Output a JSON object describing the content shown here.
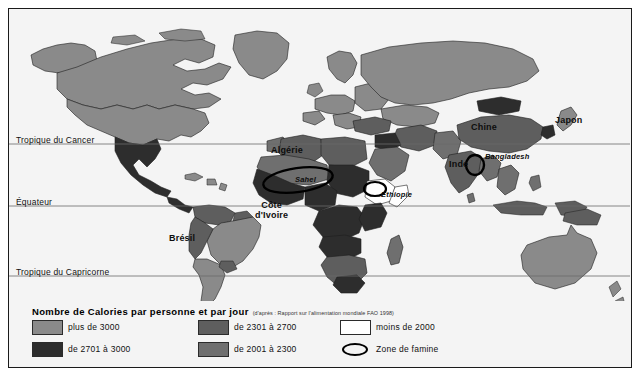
{
  "figure": {
    "kind": "thematic-world-map",
    "background_color": "#f4f4f4",
    "frame_color": "#1a1a1a"
  },
  "latitude_lines": [
    {
      "id": "tropic-cancer",
      "label": "Tropique du Cancer",
      "y": 135
    },
    {
      "id": "equator",
      "label": "Équateur",
      "y": 197
    },
    {
      "id": "tropic-capricorn",
      "label": "Tropique du Capricorne",
      "y": 267
    }
  ],
  "map_labels": [
    {
      "id": "algerie",
      "text": "Algérie",
      "x": 278,
      "y": 141
    },
    {
      "id": "cote-divoire",
      "text": "Côte",
      "text2": "d'Ivoire",
      "x": 265,
      "y": 196
    },
    {
      "id": "ethiopie",
      "text": "Éthiopie",
      "x": 372,
      "y": 186
    },
    {
      "id": "sahel",
      "text": "Sahel",
      "x": 297,
      "y": 170
    },
    {
      "id": "bresil",
      "text": "Brésil",
      "x": 175,
      "y": 229
    },
    {
      "id": "chine",
      "text": "Chine",
      "x": 478,
      "y": 118
    },
    {
      "id": "japon",
      "text": "Japon",
      "x": 561,
      "y": 111
    },
    {
      "id": "inde",
      "text": "Inde",
      "x": 457,
      "y": 155
    },
    {
      "id": "bangladesh",
      "text": "Bangladesh",
      "x": 490,
      "y": 148
    }
  ],
  "famine_zones": [
    {
      "id": "famine-sahel",
      "name": "Sahel",
      "cx": 289,
      "cy": 171,
      "rx": 35,
      "ry": 12,
      "rotation": -8
    },
    {
      "id": "famine-ethiopia",
      "name": "Éthiopie",
      "cx": 366,
      "cy": 180,
      "rx": 11,
      "ry": 7,
      "rotation": 0
    },
    {
      "id": "famine-bangladesh",
      "name": "Bangladesh",
      "cx": 466,
      "cy": 156,
      "rx": 9,
      "ry": 10,
      "rotation": 0
    }
  ],
  "legend": {
    "title": "Nombre de Calories par personne et par jour",
    "source": "(d'après : Rapport sur l'alimentation mondiale FAO 1998)",
    "columns": [
      {
        "id": "col-1",
        "entries": [
          {
            "id": "plus-3000",
            "label": "plus de 3000",
            "color": "#8a8a8a",
            "type": "swatch"
          },
          {
            "id": "2701-3000",
            "label": "de 2701 à 3000",
            "color": "#2d2d2d",
            "type": "swatch"
          }
        ]
      },
      {
        "id": "col-2",
        "entries": [
          {
            "id": "2301-2700",
            "label": "de 2301 à 2700",
            "color": "#5e5e5e",
            "type": "swatch"
          },
          {
            "id": "2001-2300",
            "label": "de 2001 à 2300",
            "color": "#6f6f6f",
            "type": "swatch"
          }
        ]
      },
      {
        "id": "col-3",
        "entries": [
          {
            "id": "moins-2000",
            "label": "moins de 2000",
            "color": "#ffffff",
            "type": "swatch"
          },
          {
            "id": "zone-famine",
            "label": "Zone de famine",
            "color": "#000000",
            "type": "ellipse"
          }
        ]
      }
    ]
  },
  "palette": {
    "plus_de_3000": "#8a8a8a",
    "de_2701_a_3000": "#2d2d2d",
    "de_2301_a_2700": "#5e5e5e",
    "de_2001_a_2300": "#6f6f6f",
    "moins_de_2000": "#ffffff",
    "ocean": "#f4f4f4",
    "border": "#1f1f1f"
  }
}
